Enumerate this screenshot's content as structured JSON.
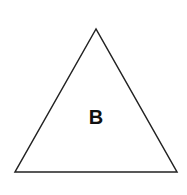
{
  "diagram": {
    "shape": "triangle",
    "label": "B",
    "stroke_color": "#222222",
    "fill_color": "#ffffff"
  }
}
